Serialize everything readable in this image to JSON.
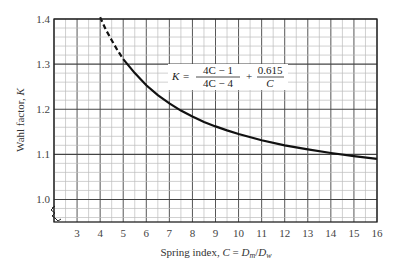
{
  "chart_data": {
    "type": "line",
    "title": "",
    "xlabel": "Spring index, C = Dm/Dw",
    "xlabel_parts": {
      "prefix": "Spring index, ",
      "var": "C",
      "eq": " = ",
      "num": "D",
      "num_sub": "m",
      "slash": "/",
      "den": "D",
      "den_sub": "w"
    },
    "ylabel": "Wahl factor, K",
    "ylabel_parts": {
      "prefix": "Wahl factor, ",
      "var": "K"
    },
    "xlim": [
      2,
      16
    ],
    "ylim": [
      0.95,
      1.4
    ],
    "x_ticks": [
      3,
      4,
      5,
      6,
      7,
      8,
      9,
      10,
      11,
      12,
      13,
      14,
      15,
      16
    ],
    "y_ticks": [
      1.0,
      1.1,
      1.2,
      1.3,
      1.4
    ],
    "y_tick_labels": [
      "1.0",
      "1.1",
      "1.2",
      "1.3",
      "1.4"
    ],
    "grid": true,
    "axis_break": "y-axis break below 1.0",
    "formula": {
      "lhs": "K",
      "eq": "=",
      "frac1_num": "4C − 1",
      "frac1_den": "4C − 4",
      "plus": "+",
      "frac2_num": "0.615",
      "frac2_den": "C"
    },
    "series": [
      {
        "name": "Wahl factor (extrapolated)",
        "style": "dashed",
        "x": [
          4.0,
          4.25,
          4.5,
          4.75,
          5.0
        ],
        "y": [
          1.404,
          1.376,
          1.353,
          1.331,
          1.311
        ]
      },
      {
        "name": "Wahl factor",
        "style": "solid",
        "x": [
          5,
          5.5,
          6,
          6.5,
          7,
          7.5,
          8,
          8.5,
          9,
          9.5,
          10,
          11,
          12,
          13,
          14,
          15,
          16
        ],
        "y": [
          1.311,
          1.28,
          1.253,
          1.231,
          1.213,
          1.197,
          1.184,
          1.172,
          1.162,
          1.153,
          1.145,
          1.131,
          1.12,
          1.111,
          1.103,
          1.096,
          1.09
        ]
      }
    ]
  }
}
